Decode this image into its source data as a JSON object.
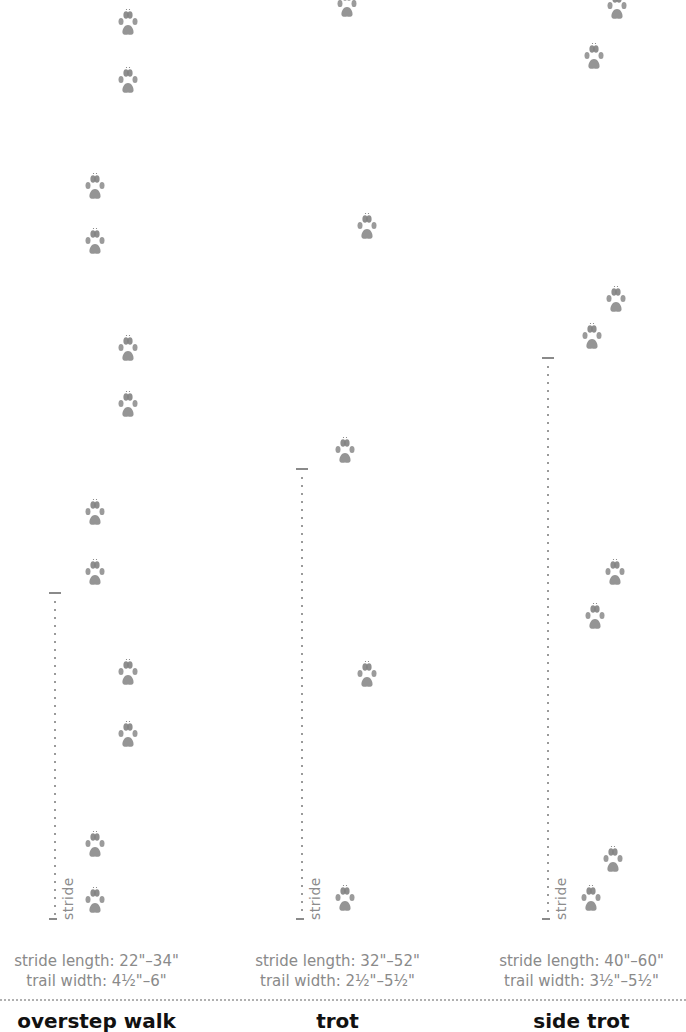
{
  "columns": [
    {
      "gait": "overstep walk",
      "stride_length": "stride length: 22\"–34\"",
      "trail_width": "trail width: 4½\"–6\"",
      "stride_label": "stride",
      "stride_marker": {
        "x": 55,
        "top": 592,
        "bottom": 918
      },
      "prints": [
        [
          128,
          8
        ],
        [
          128,
          66
        ],
        [
          95,
          172
        ],
        [
          95,
          227
        ],
        [
          128,
          334
        ],
        [
          128,
          390
        ],
        [
          95,
          498
        ],
        [
          95,
          558
        ],
        [
          128,
          658
        ],
        [
          128,
          720
        ],
        [
          95,
          830
        ],
        [
          95,
          886
        ]
      ]
    },
    {
      "gait": "trot",
      "stride_length": "stride length: 32\"–52\"",
      "trail_width": "trail width: 2½\"–5½\"",
      "stride_label": "stride",
      "stride_marker": {
        "x": 302,
        "top": 468,
        "bottom": 918
      },
      "prints": [
        [
          347,
          -10
        ],
        [
          367,
          212
        ],
        [
          345,
          436
        ],
        [
          367,
          660
        ],
        [
          345,
          884
        ]
      ]
    },
    {
      "gait": "side trot",
      "stride_length": "stride length: 40\"–60\"",
      "trail_width": "trail width: 3½\"–5½\"",
      "stride_label": "stride",
      "stride_marker": {
        "x": 548,
        "top": 357,
        "bottom": 918
      },
      "prints": [
        [
          617,
          -8
        ],
        [
          594,
          42
        ],
        [
          616,
          285
        ],
        [
          592,
          322
        ],
        [
          615,
          558
        ],
        [
          595,
          602
        ],
        [
          613,
          845
        ],
        [
          591,
          884
        ]
      ]
    }
  ],
  "colors": {
    "print": "#7a7a7a",
    "text_muted": "#8a8a8a",
    "title": "#111111"
  }
}
